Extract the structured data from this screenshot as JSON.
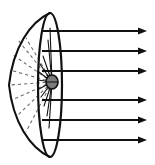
{
  "figure": {
    "background_color": "#ffffff",
    "line_color": "#111111",
    "dashed_ray_color": "#6d6d6d",
    "source_fill_color": "#7a7a7a",
    "canvas": {
      "width": 155,
      "height": 165
    }
  },
  "reflector": {
    "label": "parabolic-dish",
    "apex": {
      "x": 9,
      "y": 85
    },
    "top_rim": {
      "x": 50,
      "y": 13
    },
    "bottom_rim": {
      "x": 50,
      "y": 157
    },
    "rim_ellipse": {
      "cx": 50,
      "cy": 85,
      "rx": 12,
      "ry": 72
    }
  },
  "source": {
    "label": "light-source-at-focus",
    "cx": 52,
    "cy": 82,
    "rx": 6,
    "ry": 7
  },
  "chart_data": {
    "type": "diagram",
    "dashed_rays": [
      {
        "x1": 52,
        "y1": 82,
        "x2": 18,
        "y2": 40
      },
      {
        "x1": 52,
        "y1": 82,
        "x2": 13,
        "y2": 55
      },
      {
        "x1": 52,
        "y1": 82,
        "x2": 10,
        "y2": 70
      },
      {
        "x1": 52,
        "y1": 82,
        "x2": 10,
        "y2": 85
      },
      {
        "x1": 52,
        "y1": 82,
        "x2": 12,
        "y2": 100
      },
      {
        "x1": 52,
        "y1": 82,
        "x2": 17,
        "y2": 116
      },
      {
        "x1": 52,
        "y1": 82,
        "x2": 26,
        "y2": 132
      },
      {
        "x1": 52,
        "y1": 82,
        "x2": 26,
        "y2": 38
      }
    ],
    "solid_rays": [
      {
        "x1": 52,
        "y1": 82,
        "x2": 43,
        "y2": 56
      },
      {
        "x1": 52,
        "y1": 82,
        "x2": 40,
        "y2": 64
      },
      {
        "x1": 52,
        "y1": 82,
        "x2": 39,
        "y2": 72
      },
      {
        "x1": 52,
        "y1": 82,
        "x2": 38,
        "y2": 80
      },
      {
        "x1": 52,
        "y1": 82,
        "x2": 39,
        "y2": 89
      },
      {
        "x1": 52,
        "y1": 82,
        "x2": 41,
        "y2": 97
      },
      {
        "x1": 52,
        "y1": 82,
        "x2": 44,
        "y2": 106
      },
      {
        "x1": 52,
        "y1": 82,
        "x2": 47,
        "y2": 116
      },
      {
        "x1": 52,
        "y1": 82,
        "x2": 49,
        "y2": 128
      },
      {
        "x1": 52,
        "y1": 82,
        "x2": 48,
        "y2": 40
      },
      {
        "x1": 52,
        "y1": 82,
        "x2": 50,
        "y2": 28
      }
    ],
    "output_beams": [
      {
        "y": 31,
        "x_start": 42,
        "x_end": 147
      },
      {
        "y": 51,
        "x_start": 42,
        "x_end": 147
      },
      {
        "y": 71,
        "x_start": 42,
        "x_end": 147
      },
      {
        "y": 100,
        "x_start": 42,
        "x_end": 147
      },
      {
        "y": 120,
        "x_start": 42,
        "x_end": 147
      },
      {
        "y": 140,
        "x_start": 42,
        "x_end": 147
      }
    ],
    "beam_count": 6,
    "beam_direction": "rightward-horizontal-parallel"
  }
}
